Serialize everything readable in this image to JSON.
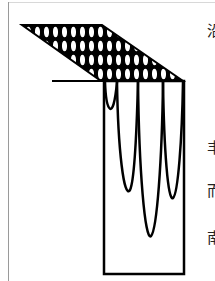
{
  "figure": {
    "trapezoid": {
      "top_left": [
        22,
        25
      ],
      "top_right": [
        102,
        25
      ],
      "bottom_left": [
        101,
        81
      ],
      "bottom_right": [
        183,
        81
      ],
      "fill_pattern": "ellipses"
    },
    "ledge_line": {
      "x1": 52,
      "y1": 81,
      "x2": 101,
      "y2": 81
    },
    "rectangle": {
      "x": 103,
      "y": 81,
      "width": 81,
      "height": 193
    },
    "curves": [
      {
        "x_left": 104,
        "x_right": 117,
        "bottom_y": 118
      },
      {
        "x_left": 117,
        "x_right": 138,
        "bottom_y": 190
      },
      {
        "x_left": 138,
        "x_right": 163,
        "bottom_y": 236
      },
      {
        "x_left": 163,
        "x_right": 183,
        "bottom_y": 198
      }
    ],
    "stroke_color": "#000000"
  },
  "side_text": [
    {
      "char": "沿",
      "y": 24
    },
    {
      "char": "丰",
      "y": 141
    },
    {
      "char": "而",
      "y": 184
    },
    {
      "char": "南",
      "y": 231
    }
  ]
}
